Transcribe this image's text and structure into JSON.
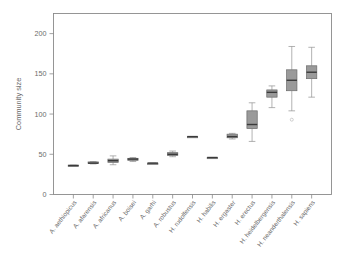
{
  "figure": {
    "background_color": "#ffffff",
    "box_fill_color": "#9a9a9a",
    "box_edge_color": "#6a6a6a",
    "median_color": "#3a3a3a",
    "axis_color": "#8a8a8a",
    "text_color": "#6b6b6b"
  },
  "axes": {
    "ylabel": "Community size",
    "xlabel": "",
    "ylim": [
      0,
      225
    ],
    "yticks": [
      0,
      50,
      100,
      150,
      200
    ],
    "ytick_labels": [
      "0",
      "50",
      "100",
      "150",
      "200"
    ],
    "grid": false
  },
  "chart_data": {
    "type": "box",
    "title": "",
    "xlabel": "",
    "ylabel": "Community size",
    "ylim": [
      0,
      225
    ],
    "yticks": [
      0,
      50,
      100,
      150,
      200
    ],
    "grid": false,
    "legend": "none",
    "categories": [
      "A. aethiopicus",
      "A. afarensis",
      "A. africanus",
      "A. boisei",
      "A. garhi",
      "A. robustus",
      "H. rudolfensis",
      "H. habilis",
      "H. ergaster",
      "H. erectus",
      "H. heidelbergensis",
      "H. neanderthalensis",
      "H. sapiens"
    ],
    "boxes": [
      {
        "category": "A. aethiopicus",
        "whisker_low": 36.0,
        "q1": 36.0,
        "median": 36.0,
        "q3": 36.5,
        "whisker_high": 36.5,
        "outliers": []
      },
      {
        "category": "A. afarensis",
        "whisker_low": 38.0,
        "q1": 38.5,
        "median": 39.0,
        "q3": 40.5,
        "whisker_high": 41.0,
        "outliers": []
      },
      {
        "category": "A. africanus",
        "whisker_low": 37.0,
        "q1": 40.0,
        "median": 42.0,
        "q3": 44.0,
        "whisker_high": 48.0,
        "outliers": []
      },
      {
        "category": "A. boisei",
        "whisker_low": 41.0,
        "q1": 42.5,
        "median": 44.0,
        "q3": 45.0,
        "whisker_high": 46.0,
        "outliers": []
      },
      {
        "category": "A. garhi",
        "whisker_low": 38.5,
        "q1": 38.5,
        "median": 39.0,
        "q3": 39.0,
        "whisker_high": 39.0,
        "outliers": []
      },
      {
        "category": "A. robustus",
        "whisker_low": 47.0,
        "q1": 48.5,
        "median": 50.0,
        "q3": 52.0,
        "whisker_high": 54.0,
        "outliers": []
      },
      {
        "category": "H. rudolfensis",
        "whisker_low": 71.5,
        "q1": 71.5,
        "median": 72.0,
        "q3": 72.0,
        "whisker_high": 72.0,
        "outliers": []
      },
      {
        "category": "H. habilis",
        "whisker_low": 45.5,
        "q1": 45.5,
        "median": 46.0,
        "q3": 46.0,
        "whisker_high": 46.0,
        "outliers": []
      },
      {
        "category": "H. ergaster",
        "whisker_low": 69.0,
        "q1": 70.5,
        "median": 72.0,
        "q3": 75.0,
        "whisker_high": 76.0,
        "outliers": []
      },
      {
        "category": "H. erectus",
        "whisker_low": 66.0,
        "q1": 82.0,
        "median": 87.0,
        "q3": 104.0,
        "whisker_high": 114.0,
        "outliers": []
      },
      {
        "category": "H. heidelbergensis",
        "whisker_low": 108.0,
        "q1": 121.0,
        "median": 127.0,
        "q3": 130.0,
        "whisker_high": 135.0,
        "outliers": []
      },
      {
        "category": "H. neanderthalensis",
        "whisker_low": 104.0,
        "q1": 129.0,
        "median": 142.0,
        "q3": 155.0,
        "whisker_high": 184.0,
        "outliers": [
          93.0
        ]
      },
      {
        "category": "H. sapiens",
        "whisker_low": 121.0,
        "q1": 144.0,
        "median": 152.0,
        "q3": 160.0,
        "whisker_high": 183.0,
        "outliers": []
      }
    ]
  }
}
